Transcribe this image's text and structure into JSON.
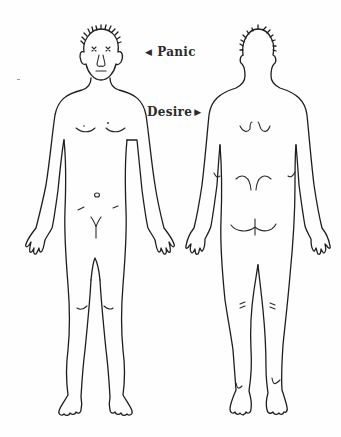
{
  "diagram": {
    "type": "body-map",
    "figures": [
      {
        "id": "front",
        "view": "front",
        "face": "x-eyes"
      },
      {
        "id": "back",
        "view": "back"
      }
    ],
    "labels": [
      {
        "id": "panic",
        "text": "Panic",
        "arrow": "◀",
        "arrow_direction": "left",
        "points_to": "front figure head"
      },
      {
        "id": "desire",
        "text": "Desire",
        "arrow": "▶",
        "arrow_direction": "right",
        "points_to": "back figure upper back"
      }
    ],
    "colors": {
      "line": "#1e1e1e",
      "label_text": "#2b2b2b",
      "background": "#fefefe"
    }
  }
}
